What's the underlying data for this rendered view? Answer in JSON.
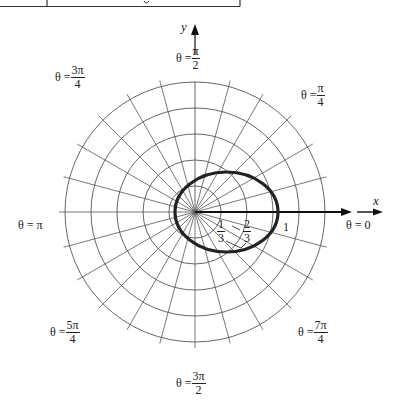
{
  "table_fragment": {
    "description": "Bottom edge of a table cut off at the top of the crop",
    "visible_text": []
  },
  "axes": {
    "x_label": "x",
    "y_label": "y"
  },
  "angle_labels": [
    {
      "id": "theta-0",
      "prefix": "θ = ",
      "value": "0"
    },
    {
      "id": "theta-pi-4",
      "prefix": "θ = ",
      "num": "π",
      "den": "4"
    },
    {
      "id": "theta-pi-2",
      "prefix": "θ = ",
      "num": "π",
      "den": "2"
    },
    {
      "id": "theta-3pi-4",
      "prefix": "θ = ",
      "num": "3π",
      "den": "4"
    },
    {
      "id": "theta-pi",
      "prefix": "θ = ",
      "value": "π"
    },
    {
      "id": "theta-5pi-4",
      "prefix": "θ = ",
      "num": "5π",
      "den": "4"
    },
    {
      "id": "theta-3pi-2",
      "prefix": "θ = ",
      "num": "3π",
      "den": "2"
    },
    {
      "id": "theta-7pi-4",
      "prefix": "θ = ",
      "num": "7π",
      "den": "4"
    }
  ],
  "radial_ticks": [
    {
      "num": "1",
      "den": "3"
    },
    {
      "num": "2",
      "den": "3"
    },
    {
      "value": "1"
    }
  ],
  "grid": {
    "rings": 5,
    "ring_spacing_px": 26,
    "radial_line_step_deg": 15
  },
  "curve": {
    "shape_source": "measured from pixels",
    "note": "Closed oval passing left of the pole and crossing the positive x-axis near the '1' tick; the formula is not stated in the image",
    "stroke": "#222222"
  },
  "colors": {
    "ink": "#222222",
    "grid": "#555555",
    "background": "#ffffff"
  }
}
